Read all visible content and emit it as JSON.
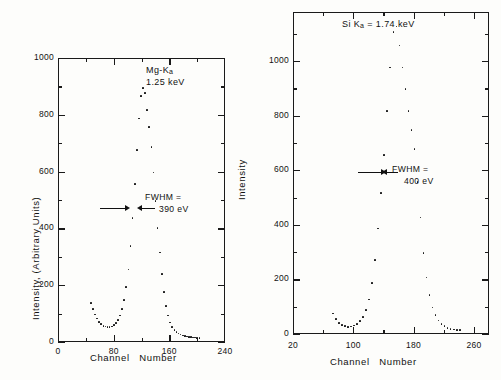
{
  "figure": {
    "background": "#fdfdfb",
    "ink": "#101010"
  },
  "chart_data": [
    {
      "type": "scatter",
      "id": "left-panel",
      "title": "",
      "xlabel": "Channel  Number",
      "ylabel": "Intensity, (Arbitrary Units)",
      "xlim": [
        0,
        240
      ],
      "ylim": [
        0,
        1000
      ],
      "xticks": [
        0,
        80,
        160,
        240
      ],
      "xtick_labels": [
        "0",
        "80",
        "160",
        "240"
      ],
      "yticks": [
        0,
        200,
        400,
        600,
        800,
        1000
      ],
      "ytick_labels": [
        "0",
        "200",
        "400",
        "600",
        "800",
        "1000"
      ],
      "minor_xticks": [
        40,
        120,
        200
      ],
      "minor_yticks": [
        100,
        300,
        500,
        700,
        900
      ],
      "grid": false,
      "legend": "none",
      "annotations": [
        {
          "name": "peak-line-label",
          "text": "Mg-K",
          "sub": "a",
          "text2": "1.25 keV",
          "x": 150,
          "y": 905
        },
        {
          "name": "fwhm-label",
          "text": "FWHM =",
          "text2": "390 eV",
          "x": 152,
          "y": 470
        }
      ],
      "fwhm_marker": {
        "y": 450,
        "left_x": 84,
        "right_x": 136,
        "label": "390 eV"
      },
      "x": [
        46,
        49,
        52,
        55,
        58,
        61,
        64,
        67,
        70,
        73,
        76,
        79,
        82,
        85,
        88,
        91,
        94,
        97,
        100,
        103,
        106,
        109,
        112,
        115,
        118,
        121,
        124,
        127,
        130,
        133,
        136,
        139,
        142,
        145,
        148,
        151,
        154,
        157,
        160,
        163,
        166,
        169,
        172,
        175,
        178,
        181,
        184,
        187,
        190,
        193,
        196,
        199,
        202
      ],
      "values": [
        140,
        118,
        100,
        86,
        74,
        66,
        60,
        57,
        55,
        55,
        57,
        62,
        70,
        80,
        96,
        118,
        150,
        196,
        258,
        340,
        440,
        560,
        680,
        790,
        870,
        898,
        880,
        820,
        760,
        690,
        600,
        500,
        405,
        318,
        242,
        178,
        130,
        96,
        72,
        56,
        46,
        38,
        33,
        29,
        26,
        24,
        22,
        21,
        20,
        19,
        19,
        18,
        18
      ]
    },
    {
      "type": "scatter",
      "id": "right-panel",
      "title": "",
      "xlabel": "Channel  Number",
      "ylabel": "Intensity",
      "xlim": [
        20,
        280
      ],
      "ylim": [
        0,
        1180
      ],
      "xticks": [
        20,
        100,
        180,
        260
      ],
      "xtick_labels": [
        "20",
        "100",
        "180",
        "260"
      ],
      "yticks": [
        0,
        200,
        400,
        600,
        800,
        1000
      ],
      "ytick_labels": [
        "0",
        "200",
        "400",
        "600",
        "800",
        "1000"
      ],
      "minor_xticks": [
        60,
        140,
        220
      ],
      "minor_yticks": [
        100,
        300,
        500,
        700,
        900,
        1100
      ],
      "grid": false,
      "legend": "none",
      "annotations": [
        {
          "name": "peak-line-label",
          "text": "Si K",
          "sub": "a",
          "text2": " = 1.74 keV",
          "x": 150,
          "y": 1150
        },
        {
          "name": "fwhm-label",
          "text": "FWHM =",
          "text2": "400 eV",
          "x": 196,
          "y": 570
        }
      ],
      "fwhm_marker": {
        "y": 560,
        "left_x": 132,
        "right_x": 178,
        "label": "400 eV"
      },
      "x": [
        72,
        76,
        80,
        84,
        88,
        92,
        96,
        100,
        104,
        108,
        112,
        116,
        120,
        124,
        128,
        132,
        136,
        140,
        144,
        148,
        152,
        156,
        160,
        164,
        168,
        172,
        176,
        180,
        184,
        188,
        192,
        196,
        200,
        204,
        208,
        212,
        216,
        220,
        224,
        228,
        232,
        236,
        240
      ],
      "values": [
        78,
        58,
        44,
        36,
        32,
        30,
        31,
        34,
        40,
        50,
        66,
        92,
        130,
        190,
        275,
        390,
        520,
        660,
        820,
        980,
        1110,
        1130,
        1060,
        980,
        900,
        820,
        750,
        680,
        560,
        430,
        300,
        210,
        145,
        100,
        72,
        52,
        40,
        32,
        26,
        22,
        20,
        18,
        17
      ]
    }
  ],
  "left": {
    "ylabel": "Intensity, (Arbitrary Units)",
    "xlabel_part1": "Channel",
    "xlabel_part2": "Number",
    "peak_element": "Mg-K",
    "peak_sub": "a",
    "peak_energy": "1.25 keV",
    "fwhm_label": "FWHM =",
    "fwhm_value": "390 eV",
    "ytick_labels": [
      "1000",
      "800",
      "600",
      "400",
      "200",
      "0"
    ],
    "xtick_labels": [
      "0",
      "80",
      "160",
      "240"
    ]
  },
  "right": {
    "ylabel": "Intensity",
    "xlabel_part1": "Channel",
    "xlabel_part2": "Number",
    "peak_element": "Si K",
    "peak_sub": "a",
    "peak_energy": " = 1.74 keV",
    "fwhm_label": "FWHM =",
    "fwhm_value": "400 eV",
    "ytick_labels": [
      "1000",
      "800",
      "600",
      "400",
      "200",
      "0"
    ],
    "xtick_labels": [
      "20",
      "100",
      "180",
      "260"
    ]
  }
}
